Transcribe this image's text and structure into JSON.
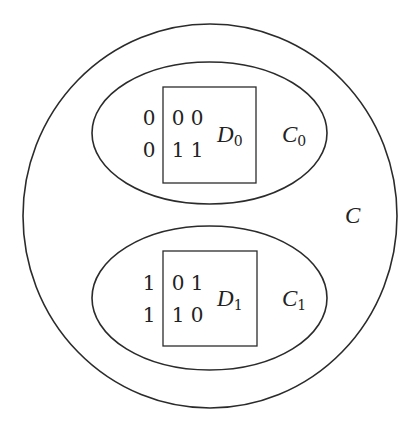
{
  "diagram": {
    "outer_set": {
      "label": "C"
    },
    "subsets": [
      {
        "label": "C",
        "label_subscript": "0",
        "inner_box": {
          "label": "D",
          "label_subscript": "0",
          "rows": [
            {
              "prefix": "0",
              "cells": [
                "0",
                "0"
              ]
            },
            {
              "prefix": "0",
              "cells": [
                "1",
                "1"
              ]
            }
          ]
        }
      },
      {
        "label": "C",
        "label_subscript": "1",
        "inner_box": {
          "label": "D",
          "label_subscript": "1",
          "rows": [
            {
              "prefix": "1",
              "cells": [
                "0",
                "1"
              ]
            },
            {
              "prefix": "1",
              "cells": [
                "1",
                "0"
              ]
            }
          ]
        }
      }
    ]
  }
}
